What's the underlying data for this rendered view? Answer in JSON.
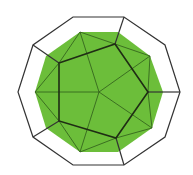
{
  "figure": {
    "title": "",
    "colors": {
      "background": "#ffffff",
      "fill": "#6cbe3a",
      "outline": "#333333",
      "pentagon": "#1f2d14",
      "thin_edges": "#2f5a1a"
    },
    "outer_decagon": [
      [
        73,
        17
      ],
      [
        124,
        17
      ],
      [
        165,
        45
      ],
      [
        180,
        92
      ],
      [
        165,
        137
      ],
      [
        124,
        165
      ],
      [
        73,
        165
      ],
      [
        33,
        137
      ],
      [
        18,
        92
      ],
      [
        33,
        45
      ]
    ],
    "green_decagon": [
      [
        80,
        32
      ],
      [
        118,
        32
      ],
      [
        150,
        56
      ],
      [
        163,
        92
      ],
      [
        152,
        128
      ],
      [
        118,
        152
      ],
      [
        80,
        152
      ],
      [
        46,
        128
      ],
      [
        35,
        92
      ],
      [
        46,
        56
      ]
    ],
    "pentagon": [
      [
        59,
        63
      ],
      [
        115,
        44
      ],
      [
        148,
        92
      ],
      [
        116,
        138
      ],
      [
        59,
        121
      ]
    ],
    "center": [
      99,
      92
    ],
    "connectors": [
      [
        [
          33,
          45
        ],
        [
          59,
          63
        ]
      ],
      [
        [
          124,
          17
        ],
        [
          115,
          44
        ]
      ],
      [
        [
          180,
          92
        ],
        [
          148,
          92
        ]
      ],
      [
        [
          124,
          165
        ],
        [
          116,
          138
        ]
      ],
      [
        [
          33,
          137
        ],
        [
          59,
          121
        ]
      ]
    ],
    "thin_edges": [
      [
        [
          99,
          92
        ],
        [
          35,
          92
        ]
      ],
      [
        [
          99,
          92
        ],
        [
          80,
          32
        ]
      ],
      [
        [
          99,
          92
        ],
        [
          150,
          56
        ]
      ],
      [
        [
          99,
          92
        ],
        [
          152,
          128
        ]
      ],
      [
        [
          99,
          92
        ],
        [
          80,
          152
        ]
      ],
      [
        [
          80,
          32
        ],
        [
          59,
          63
        ]
      ],
      [
        [
          80,
          32
        ],
        [
          115,
          44
        ]
      ],
      [
        [
          150,
          56
        ],
        [
          115,
          44
        ]
      ],
      [
        [
          150,
          56
        ],
        [
          148,
          92
        ]
      ],
      [
        [
          152,
          128
        ],
        [
          148,
          92
        ]
      ],
      [
        [
          152,
          128
        ],
        [
          116,
          138
        ]
      ],
      [
        [
          80,
          152
        ],
        [
          116,
          138
        ]
      ],
      [
        [
          80,
          152
        ],
        [
          59,
          121
        ]
      ],
      [
        [
          35,
          92
        ],
        [
          59,
          121
        ]
      ],
      [
        [
          35,
          92
        ],
        [
          59,
          63
        ]
      ]
    ]
  }
}
